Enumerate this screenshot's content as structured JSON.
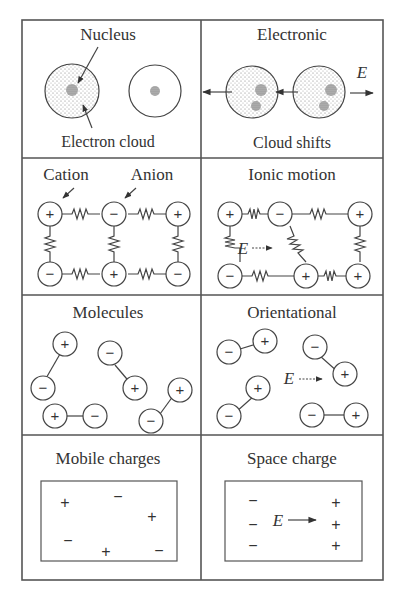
{
  "figure": {
    "panels": [
      {
        "id": "electronic-left",
        "title": "Nucleus",
        "caption": "Electron cloud"
      },
      {
        "id": "electronic-right",
        "title": "Electronic",
        "caption": "Cloud shifts",
        "field_label": "E"
      },
      {
        "id": "ionic-left",
        "labels": [
          "Cation",
          "Anion"
        ]
      },
      {
        "id": "ionic-right",
        "title": "Ionic motion",
        "field_label": "E"
      },
      {
        "id": "orientational-left",
        "title": "Molecules"
      },
      {
        "id": "orientational-right",
        "title": "Orientational",
        "field_label": "E"
      },
      {
        "id": "space-left",
        "title": "Mobile charges"
      },
      {
        "id": "space-right",
        "title": "Space charge",
        "field_label": "E"
      }
    ],
    "signs": {
      "plus": "+",
      "minus": "−"
    },
    "colors": {
      "line": "#444444",
      "frame": "#555555",
      "background": "#ffffff",
      "stipple": "#888888"
    }
  }
}
